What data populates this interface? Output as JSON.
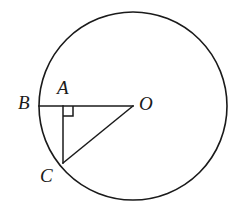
{
  "figure": {
    "kind": "circle-geometry-diagram",
    "background_color": "#ffffff",
    "stroke_color": "#1a1a1a",
    "labels": {
      "B": "B",
      "A": "A",
      "O": "O",
      "C": "C"
    },
    "icons": {
      "right_angle": "right-angle-marker"
    }
  },
  "chart_data": {
    "type": "diagram",
    "title": "",
    "circle": {
      "center": {
        "x": 133,
        "y": 106
      },
      "radius": 94,
      "stroke_width": 1.6
    },
    "points": [
      {
        "name": "B",
        "x": 39,
        "y": 106,
        "on_circle": true,
        "label_offset": {
          "dx": -21,
          "dy": -13
        }
      },
      {
        "name": "A",
        "x": 63,
        "y": 106,
        "on_circle": false,
        "label_offset": {
          "dx": -6,
          "dy": -28
        }
      },
      {
        "name": "O",
        "x": 133,
        "y": 106,
        "on_circle": false,
        "label_offset": {
          "dx": 6,
          "dy": -12
        }
      },
      {
        "name": "C",
        "x": 63,
        "y": 163,
        "on_circle": true,
        "label_offset": {
          "dx": -23,
          "dy": 3
        }
      }
    ],
    "segments": [
      {
        "name": "BO",
        "from": "B",
        "to": "O",
        "x1": 39,
        "y1": 106,
        "x2": 133,
        "y2": 106
      },
      {
        "name": "AC",
        "from": "A",
        "to": "C",
        "x1": 63,
        "y1": 106,
        "x2": 63,
        "y2": 163
      },
      {
        "name": "CO",
        "from": "C",
        "to": "O",
        "x1": 63,
        "y1": 163,
        "x2": 133,
        "y2": 106
      }
    ],
    "right_angle": {
      "at": "A",
      "between": [
        "AB",
        "AC"
      ],
      "size": 10,
      "path": "M 63 116 L 73 116 L 73 106"
    },
    "xlabel": "",
    "ylabel": "",
    "grid": false,
    "legend": null
  }
}
